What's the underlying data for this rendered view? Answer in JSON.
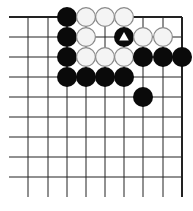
{
  "diagram": {
    "type": "go-board-fragment",
    "grid": {
      "columns_x": [
        28,
        48,
        67,
        86,
        105,
        124,
        143,
        163,
        182
      ],
      "rows_y": [
        17,
        37,
        57,
        77,
        97,
        117,
        137,
        157,
        177
      ],
      "left_open_x": 9,
      "bottom_open_y": 197,
      "top_edge": true,
      "right_edge": true,
      "line_color": "#222222",
      "edge_width": 2,
      "line_width": 1
    },
    "stone_radius": 10,
    "colors": {
      "black": "#0a0a0a",
      "white_fill": "#f4f4f4",
      "white_stroke": "#8a8a8a",
      "marker": "#ffffff"
    },
    "stones": [
      {
        "color": "black",
        "x": 67,
        "y": 17
      },
      {
        "color": "white",
        "x": 86,
        "y": 17
      },
      {
        "color": "white",
        "x": 105,
        "y": 17
      },
      {
        "color": "white",
        "x": 124,
        "y": 17
      },
      {
        "color": "black",
        "x": 67,
        "y": 37
      },
      {
        "color": "white",
        "x": 86,
        "y": 37
      },
      {
        "color": "black",
        "x": 124,
        "y": 37,
        "marker": "triangle"
      },
      {
        "color": "white",
        "x": 143,
        "y": 37
      },
      {
        "color": "white",
        "x": 163,
        "y": 37
      },
      {
        "color": "black",
        "x": 67,
        "y": 57
      },
      {
        "color": "white",
        "x": 86,
        "y": 57
      },
      {
        "color": "white",
        "x": 105,
        "y": 57
      },
      {
        "color": "white",
        "x": 124,
        "y": 57
      },
      {
        "color": "black",
        "x": 143,
        "y": 57
      },
      {
        "color": "black",
        "x": 163,
        "y": 57
      },
      {
        "color": "black",
        "x": 182,
        "y": 57
      },
      {
        "color": "black",
        "x": 67,
        "y": 77
      },
      {
        "color": "black",
        "x": 86,
        "y": 77
      },
      {
        "color": "black",
        "x": 105,
        "y": 77
      },
      {
        "color": "black",
        "x": 124,
        "y": 77
      },
      {
        "color": "black",
        "x": 143,
        "y": 97
      }
    ]
  }
}
